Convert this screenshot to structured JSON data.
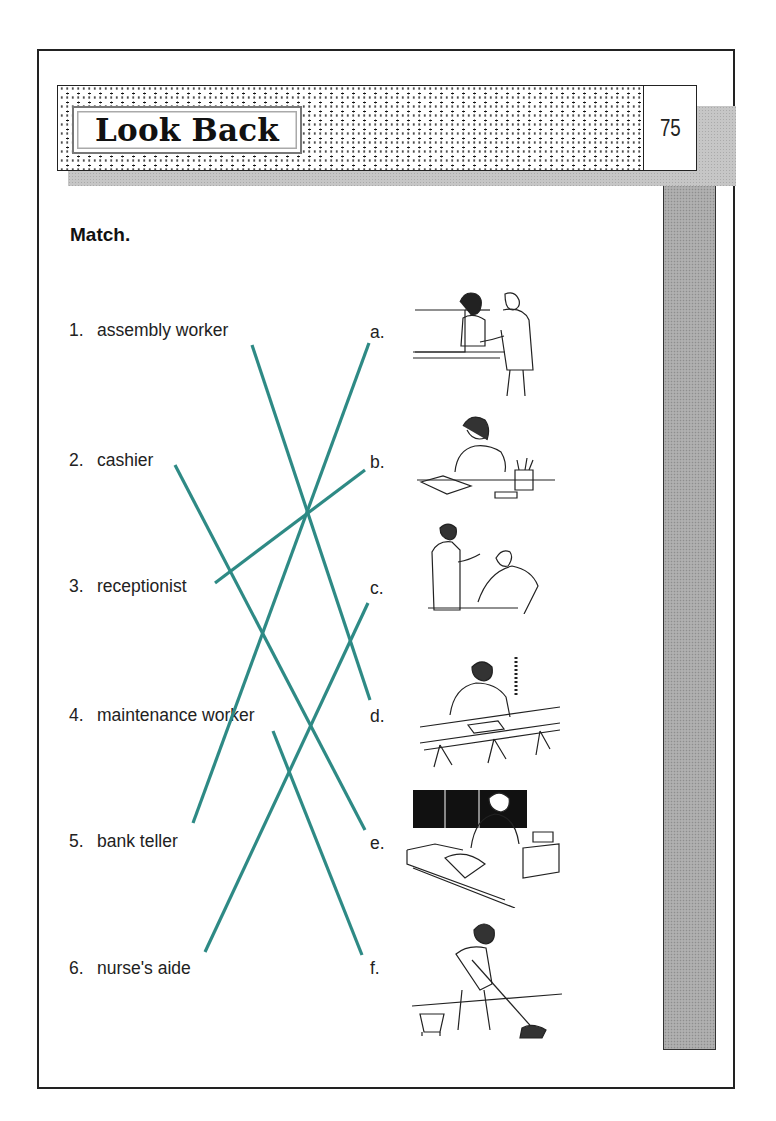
{
  "header": {
    "title": "Look Back",
    "page_number": "75"
  },
  "instruction": "Match.",
  "terms": [
    {
      "num": "1.",
      "label": "assembly worker"
    },
    {
      "num": "2.",
      "label": "cashier"
    },
    {
      "num": "3.",
      "label": "receptionist"
    },
    {
      "num": "4.",
      "label": "maintenance worker"
    },
    {
      "num": "5.",
      "label": "bank teller"
    },
    {
      "num": "6.",
      "label": "nurse's aide"
    }
  ],
  "letters": [
    "a.",
    "b.",
    "c.",
    "d.",
    "e.",
    "f."
  ],
  "pictures": [
    {
      "letter": "a",
      "depicts": "bank teller serving customer at counter"
    },
    {
      "letter": "b",
      "depicts": "receptionist on telephone at desk"
    },
    {
      "letter": "c",
      "depicts": "nurse's aide attending patient"
    },
    {
      "letter": "d",
      "depicts": "assembly worker at conveyor line"
    },
    {
      "letter": "e",
      "depicts": "cashier at checkout register"
    },
    {
      "letter": "f",
      "depicts": "maintenance worker mopping floor"
    }
  ],
  "answer_lines": [
    {
      "from": "1",
      "to": "d"
    },
    {
      "from": "2",
      "to": "e"
    },
    {
      "from": "3",
      "to": "b"
    },
    {
      "from": "4",
      "to": "f"
    },
    {
      "from": "5",
      "to": "a"
    },
    {
      "from": "6",
      "to": "c"
    }
  ],
  "colors": {
    "answer_line": "#2e8a85",
    "side_bar": "#a9a9a9",
    "border": "#222222"
  }
}
